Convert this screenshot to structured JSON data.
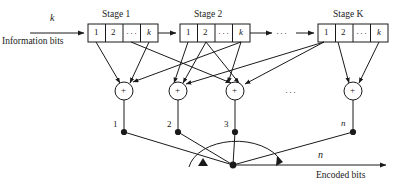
{
  "figure": {
    "kind": "convolutional-encoder-block-diagram",
    "ink_color": "#1a1a1a",
    "background": "#ffffff"
  },
  "input": {
    "rate_label": "k",
    "caption": "Information bits"
  },
  "output": {
    "rate_label": "n",
    "caption": "Encoded bits"
  },
  "stages": [
    {
      "title": "Stage 1",
      "index_label": "1",
      "cells": [
        "1",
        "2",
        "···",
        "k"
      ]
    },
    {
      "title": "Stage 2",
      "index_label": "2",
      "cells": [
        "1",
        "2",
        "···",
        "k"
      ]
    },
    {
      "title": "Stage K",
      "index_label": "K",
      "cells": [
        "1",
        "2",
        "···",
        "k"
      ]
    }
  ],
  "stage_gap_ellipsis": "···",
  "adders": {
    "symbol": "+",
    "gap_ellipsis": "···",
    "output_labels": [
      "1",
      "2",
      "3",
      "n"
    ]
  }
}
